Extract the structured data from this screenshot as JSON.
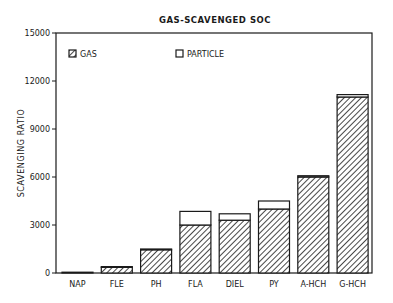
{
  "chart_data": {
    "type": "bar",
    "stacked": true,
    "title": "GAS-SCAVENGED SOC",
    "xlabel": "",
    "ylabel": "SCAVENGING RATIO",
    "ylim": [
      0,
      15000
    ],
    "yticks": [
      0,
      3000,
      6000,
      9000,
      12000,
      15000
    ],
    "ytick_labels": [
      "0",
      "3000",
      "6000",
      "9000",
      "12000",
      "15000"
    ],
    "grid": false,
    "legend_position": "top-left inside",
    "categories": [
      "NAP",
      "FLE",
      "PH",
      "FLA",
      "DIEL",
      "PY",
      "A-HCH",
      "G-HCH"
    ],
    "series": [
      {
        "name": "GAS",
        "pattern": "hatched",
        "values": [
          50,
          350,
          1450,
          3000,
          3300,
          4000,
          6000,
          11000
        ]
      },
      {
        "name": "PARTICLE",
        "pattern": "empty",
        "values": [
          0,
          50,
          50,
          850,
          400,
          500,
          80,
          150
        ]
      }
    ]
  },
  "legend": {
    "gas_label": "GAS",
    "particle_label": "PARTICLE"
  },
  "colors": {
    "ink": "#1a1a1a",
    "background": "#ffffff"
  }
}
